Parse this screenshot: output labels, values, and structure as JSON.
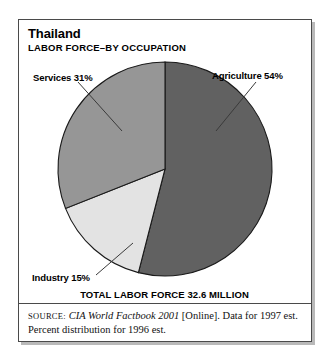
{
  "header": {
    "title": "Thailand",
    "subtitle": "LABOR FORCE–BY OCCUPATION"
  },
  "labels": {
    "services": "Services 31%",
    "agriculture": "Agriculture 54%",
    "industry": "Industry 15%"
  },
  "total_line": "TOTAL LABOR FORCE 32.6 MILLION",
  "source": {
    "prefix": "SOURCE:",
    "work_italic": "CIA World Factbook 2001",
    "rest": " [Online]. Data for 1997 est. Percent distribution for 1996 est."
  },
  "colors": {
    "agriculture": "#616161",
    "services": "#969696",
    "industry": "#e3e3e3",
    "outline": "#1a1a1a",
    "frame": "#4a4a4a",
    "shadow": "#b9b9b9",
    "leader": "#3a3a3a"
  },
  "chart_data": {
    "type": "pie",
    "title": "Thailand",
    "subtitle": "LABOR FORCE–BY OCCUPATION",
    "categories": [
      "Agriculture",
      "Industry",
      "Services"
    ],
    "values": [
      54,
      15,
      31
    ],
    "value_unit": "percent",
    "data_labels": [
      "Agriculture 54%",
      "Industry 15%",
      "Services 31%"
    ],
    "slice_colors": [
      "#616161",
      "#e3e3e3",
      "#969696"
    ],
    "start_angle_deg": 0,
    "direction": "clockwise",
    "legend": "none (direct labels with leader lines)",
    "grid": false,
    "annotation": "TOTAL LABOR FORCE 32.6 MILLION",
    "total_labor_force_millions": 32.6,
    "source": "CIA World Factbook 2001 [Online]. Data for 1997 est. Percent distribution for 1996 est."
  }
}
